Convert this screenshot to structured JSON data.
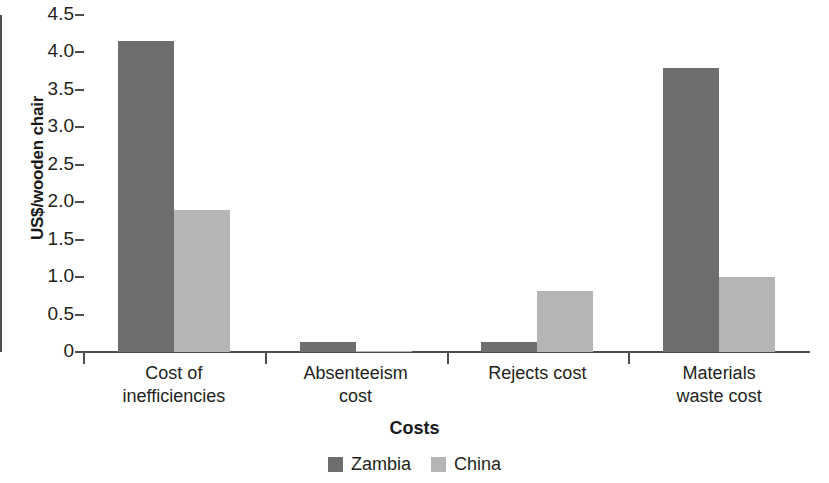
{
  "chart_data": {
    "type": "bar",
    "title": "",
    "xlabel": "Costs",
    "ylabel": "US$/wooden chair",
    "categories": [
      "Cost of inefficiencies",
      "Absenteeism cost",
      "Rejects cost",
      "Materials waste cost"
    ],
    "category_lines": [
      [
        "Cost of",
        "inefficiencies"
      ],
      [
        "Absenteeism",
        "cost"
      ],
      [
        "Rejects cost",
        ""
      ],
      [
        "Materials",
        "waste cost"
      ]
    ],
    "series": [
      {
        "name": "Zambia",
        "color": "#6e6e6e",
        "values": [
          4.15,
          0.14,
          0.14,
          3.79
        ]
      },
      {
        "name": "China",
        "color": "#b5b5b5",
        "values": [
          1.9,
          0.01,
          0.82,
          1.0
        ]
      }
    ],
    "ylim": [
      0,
      4.5
    ],
    "yticks": [
      0,
      0.5,
      1.0,
      1.5,
      2.0,
      2.5,
      3.0,
      3.5,
      4.0,
      4.5
    ],
    "ytick_labels": [
      "0",
      "0.5",
      "1.0",
      "1.5",
      "2.0",
      "2.5",
      "3.0",
      "3.5",
      "4.0",
      "4.5"
    ],
    "grid": false,
    "legend_position": "bottom"
  },
  "legend": {
    "items": [
      {
        "label": "Zambia",
        "color": "#6e6e6e"
      },
      {
        "label": "China",
        "color": "#b5b5b5"
      }
    ]
  },
  "axes": {
    "x_title": "Costs",
    "y_title": "US$/wooden chair"
  }
}
